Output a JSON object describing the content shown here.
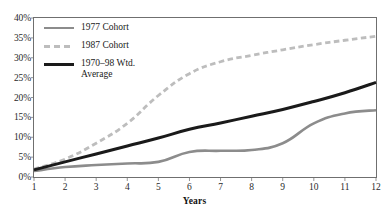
{
  "chart_data": {
    "type": "line",
    "title": "",
    "subtitle": "",
    "xlabel": "Years",
    "ylabel": "",
    "xlim": [
      1,
      12
    ],
    "ylim": [
      0,
      40
    ],
    "grid": false,
    "legend_position": "top-left",
    "x": [
      1,
      2,
      3,
      4,
      5,
      6,
      7,
      8,
      9,
      10,
      11,
      12
    ],
    "x_tick_labels": [
      "1",
      "2",
      "3",
      "4",
      "5",
      "6",
      "7",
      "8",
      "9",
      "10",
      "11",
      "12"
    ],
    "y_tick_values": [
      0,
      5,
      10,
      15,
      20,
      25,
      30,
      35,
      40
    ],
    "y_tick_labels": [
      "0%",
      "5%",
      "10%",
      "15%",
      "20%",
      "25%",
      "30%",
      "35%",
      "40%"
    ],
    "series": [
      {
        "name": "1977 Cohort",
        "style": "solid",
        "color": "#8c8c8c",
        "width": 2.6,
        "values": [
          1.5,
          2.5,
          3.0,
          3.4,
          3.8,
          6.3,
          6.6,
          6.8,
          8.5,
          13.5,
          16.0,
          16.8
        ]
      },
      {
        "name": "1987 Cohort",
        "style": "dashed",
        "color": "#bdbdbd",
        "width": 2.8,
        "values": [
          2.0,
          4.5,
          8.5,
          13.5,
          20.5,
          26.0,
          29.0,
          30.6,
          32.0,
          33.3,
          34.4,
          35.4
        ]
      },
      {
        "name": "1970–98 Wtd.\nAverage",
        "style": "solid",
        "color": "#1a1a1a",
        "width": 3.0,
        "values": [
          1.8,
          3.8,
          5.8,
          7.8,
          9.8,
          12.0,
          13.6,
          15.3,
          17.0,
          19.0,
          21.2,
          23.8
        ]
      }
    ]
  },
  "legend": {
    "items": [
      {
        "label": "1977 Cohort"
      },
      {
        "label": "1987 Cohort"
      },
      {
        "label": "1970–98 Wtd.\nAverage"
      }
    ]
  },
  "axes": {
    "x_title": "Years"
  }
}
